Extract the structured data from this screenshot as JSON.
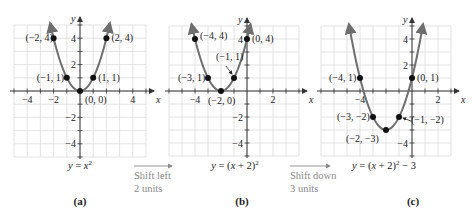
{
  "colors": {
    "grid": "#dcdcdc",
    "axis": "#333333",
    "curve": "#6e6e6e",
    "point": "#111111",
    "shift_text": "#8a8a8a"
  },
  "panels": [
    {
      "id": "a",
      "caption": "(a)",
      "equation_prefix": "y = x",
      "equation_exp": "2",
      "equation_suffix": "",
      "origin": [
        80,
        91
      ],
      "unit": 13.2,
      "grid_x": [
        -5,
        5
      ],
      "grid_y": [
        -5,
        5
      ],
      "x_ticks": [
        {
          "v": -4,
          "label": "−4"
        },
        {
          "v": -2,
          "label": "−2"
        },
        {
          "v": 4,
          "label": "4"
        }
      ],
      "y_ticks": [
        {
          "v": 4,
          "label": "4"
        },
        {
          "v": 2,
          "label": "2"
        },
        {
          "v": -2,
          "label": "−2"
        },
        {
          "v": -4,
          "label": "−4"
        }
      ],
      "h": 0,
      "k": 0,
      "points": [
        {
          "x": -2,
          "y": 4,
          "label": "(−2, 4)",
          "dx": -28,
          "dy": 3
        },
        {
          "x": 2,
          "y": 4,
          "label": "(2, 4)",
          "dx": 5,
          "dy": 3
        },
        {
          "x": -1,
          "y": 1,
          "label": "(−1, 1)",
          "dx": -30,
          "dy": 3
        },
        {
          "x": 1,
          "y": 1,
          "label": "(1, 1)",
          "dx": 5,
          "dy": 3
        },
        {
          "x": 0,
          "y": 0,
          "label": "(0, 0)",
          "dx": 5,
          "dy": 12
        }
      ]
    },
    {
      "id": "b",
      "caption": "(b)",
      "equation_prefix": "y = (x + 2)",
      "equation_exp": "2",
      "equation_suffix": "",
      "origin": [
        247,
        91
      ],
      "unit": 13,
      "grid_x": [
        -6,
        4
      ],
      "grid_y": [
        -5,
        5
      ],
      "x_ticks": [
        {
          "v": -4,
          "label": "−4"
        },
        {
          "v": 2,
          "label": "2"
        }
      ],
      "y_ticks": [
        {
          "v": 4,
          "label": "4"
        },
        {
          "v": -2,
          "label": "−2"
        },
        {
          "v": -4,
          "label": "−4"
        }
      ],
      "h": -2,
      "k": 0,
      "points": [
        {
          "x": -4,
          "y": 4,
          "label": "(−4, 4)",
          "dx": 5,
          "dy": 0
        },
        {
          "x": 0,
          "y": 4,
          "label": "(0, 4)",
          "dx": 5,
          "dy": 3
        },
        {
          "x": -3,
          "y": 1,
          "label": "(−3, 1)",
          "dx": -30,
          "dy": 3
        },
        {
          "x": -1,
          "y": 1,
          "label": "(−1, 1)",
          "dx": -18,
          "dy": -18
        },
        {
          "x": -2,
          "y": 0,
          "label": "(−2, 0)",
          "dx": -13,
          "dy": 13
        }
      ]
    },
    {
      "id": "c",
      "caption": "(c)",
      "equation_prefix": "y = (x + 2)",
      "equation_exp": "2",
      "equation_suffix": " − 3",
      "origin": [
        412,
        91
      ],
      "unit": 13,
      "grid_x": [
        -7,
        3
      ],
      "grid_y": [
        -5,
        5
      ],
      "x_ticks": [
        {
          "v": -4,
          "label": "−4"
        },
        {
          "v": 2,
          "label": "2"
        }
      ],
      "y_ticks": [
        {
          "v": 4,
          "label": "4"
        },
        {
          "v": 2,
          "label": "2"
        },
        {
          "v": -4,
          "label": "−4"
        }
      ],
      "h": -2,
      "k": -3,
      "points": [
        {
          "x": -4,
          "y": 1,
          "label": "(−4, 1)",
          "dx": -31,
          "dy": 3
        },
        {
          "x": 0,
          "y": 1,
          "label": "(0, 1)",
          "dx": 5,
          "dy": 3
        },
        {
          "x": -3,
          "y": -2,
          "label": "(−3, −2)",
          "dx": -36,
          "dy": 3
        },
        {
          "x": -1,
          "y": -2,
          "label": "(−1, −2)",
          "dx": 12,
          "dy": 6
        },
        {
          "x": -2,
          "y": -3,
          "label": "(−2, −3)",
          "dx": -40,
          "dy": 12
        }
      ]
    }
  ],
  "axis_labels": {
    "x": "x",
    "y": "y"
  },
  "transitions": [
    {
      "line1": "Shift left",
      "line2": "2 units",
      "arrow": [
        134,
        172,
        166
      ],
      "text_x": 134
    },
    {
      "line1": "Shift down",
      "line2": "3 units",
      "arrow": [
        290,
        330,
        166
      ],
      "text_x": 290
    }
  ]
}
